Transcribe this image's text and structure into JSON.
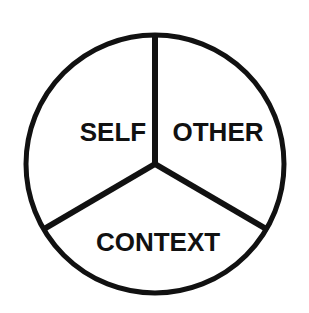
{
  "diagram": {
    "type": "three-part-circle",
    "segments": [
      {
        "label": "SELF",
        "position": "upper-left"
      },
      {
        "label": "OTHER",
        "position": "upper-right"
      },
      {
        "label": "CONTEXT",
        "position": "bottom"
      }
    ],
    "colors": {
      "stroke": "#111111",
      "fill": "#ffffff",
      "text": "#111111"
    }
  }
}
